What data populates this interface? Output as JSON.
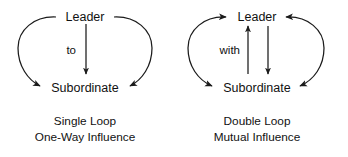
{
  "figure": {
    "background_color": "#ffffff",
    "line_color": "#1b1b1b",
    "text_color": "#111111"
  },
  "diagrams": [
    {
      "id": "single-loop",
      "nodes": {
        "top": "Leader",
        "bottom": "Subordinate"
      },
      "center_edge_label": "to",
      "center_edge_direction": "down",
      "left_arc": {
        "from": "Leader",
        "to": "Subordinate",
        "arrowheads": "end"
      },
      "right_arc": {
        "from": "Leader",
        "to": "Subordinate",
        "arrowheads": "end"
      },
      "caption": {
        "line1": "Single Loop",
        "line2": "One-Way Influence"
      }
    },
    {
      "id": "double-loop",
      "nodes": {
        "top": "Leader",
        "bottom": "Subordinate"
      },
      "center_edge_label": "with",
      "center_edge_direction": "both",
      "left_arc": {
        "from": "Subordinate",
        "to": "Leader",
        "arrowheads": "both"
      },
      "right_arc": {
        "from": "Subordinate",
        "to": "Leader",
        "arrowheads": "both"
      },
      "caption": {
        "line1": "Double Loop",
        "line2": "Mutual Influence"
      }
    }
  ]
}
